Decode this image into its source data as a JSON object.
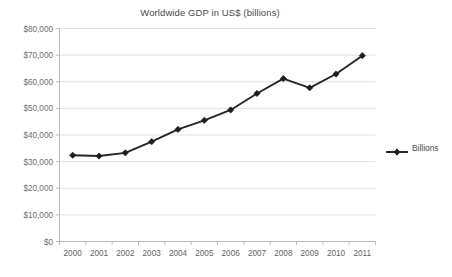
{
  "chart_data": {
    "type": "line",
    "title": "Worldwide GDP in US$ (billions)",
    "xlabel": "",
    "ylabel": "",
    "categories": [
      "2000",
      "2001",
      "2002",
      "2003",
      "2004",
      "2005",
      "2006",
      "2007",
      "2008",
      "2009",
      "2010",
      "2011"
    ],
    "series": [
      {
        "name": "Billions",
        "values": [
          32400,
          32100,
          33300,
          37500,
          42100,
          45500,
          49400,
          55600,
          61200,
          57700,
          62900,
          69800
        ]
      }
    ],
    "ylim": [
      0,
      80000
    ],
    "ytick_values": [
      0,
      10000,
      20000,
      30000,
      40000,
      50000,
      60000,
      70000,
      80000
    ],
    "ytick_labels": [
      "$0",
      "$10,000",
      "$20,000",
      "$30,000",
      "$40,000",
      "$50,000",
      "$60,000",
      "$70,000",
      "$80,000"
    ],
    "xtick_labels": [
      "2000",
      "2001",
      "2002",
      "2003",
      "2004",
      "2005",
      "2006",
      "2007",
      "2008",
      "2009",
      "2010",
      "2011"
    ],
    "grid": true,
    "legend_position": "right",
    "series_color": "#1d1d1d",
    "gridline_color": "#d9d9d9",
    "marker": "diamond"
  },
  "legend": {
    "entries": [
      {
        "label": "Billions",
        "marker": "diamond-marker",
        "color": "#1d1d1d"
      }
    ]
  },
  "caption": {
    "text": ""
  }
}
